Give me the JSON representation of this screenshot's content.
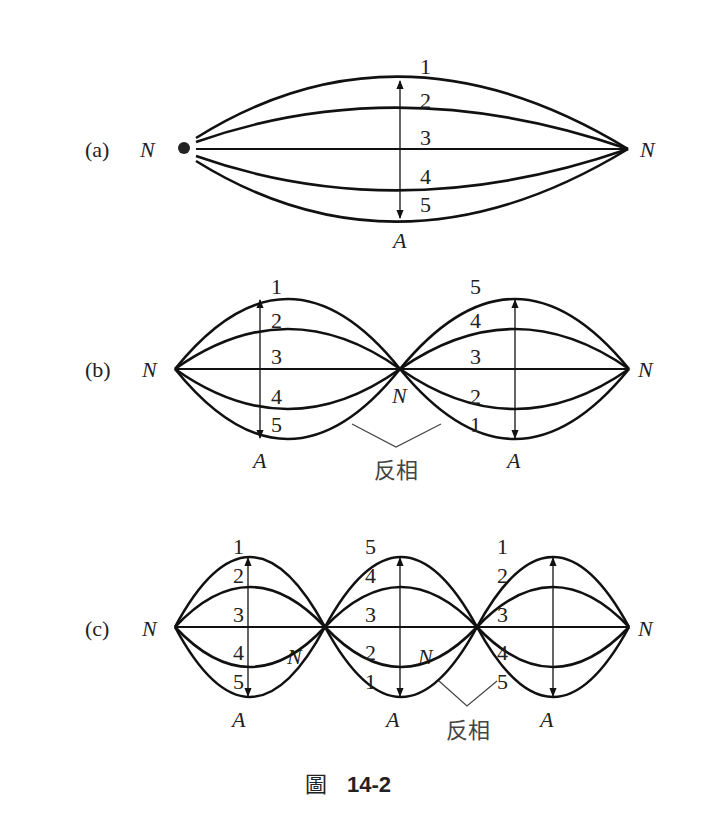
{
  "figure": {
    "caption_prefix": "圖",
    "caption_number": "14-2",
    "node_label": "N",
    "antinode_label": "A",
    "phase_label": "反相",
    "panels": [
      {
        "id": "a",
        "label": "(a)",
        "loops": 1,
        "loop_labels": [
          [
            "1",
            "2",
            "3",
            "4",
            "5"
          ]
        ]
      },
      {
        "id": "b",
        "label": "(b)",
        "loops": 2,
        "loop_labels": [
          [
            "1",
            "2",
            "3",
            "4",
            "5"
          ],
          [
            "5",
            "4",
            "3",
            "2",
            "1"
          ]
        ]
      },
      {
        "id": "c",
        "label": "(c)",
        "loops": 3,
        "loop_labels": [
          [
            "1",
            "2",
            "3",
            "4",
            "5"
          ],
          [
            "5",
            "4",
            "3",
            "2",
            "1"
          ],
          [
            "1",
            "2",
            "3",
            "4",
            "5"
          ]
        ]
      }
    ]
  }
}
